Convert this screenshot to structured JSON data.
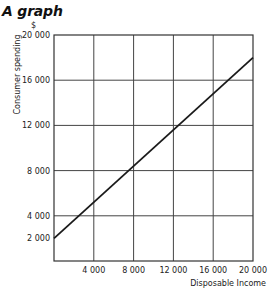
{
  "chart_data": {
    "type": "line",
    "title": "A graph",
    "xlabel": "Disposable Income",
    "ylabel": "Consumer spending",
    "y_unit": "$",
    "xlim": [
      0,
      20000
    ],
    "ylim": [
      0,
      20000
    ],
    "grid": true,
    "x_ticks": [
      4000,
      8000,
      12000,
      16000,
      20000
    ],
    "x_tick_labels": [
      "4 000",
      "8 000",
      "12 000",
      "16 000",
      "20 000"
    ],
    "y_ticks": [
      2000,
      4000,
      8000,
      12000,
      16000,
      20000
    ],
    "y_tick_labels": [
      "2 000",
      "4 000",
      "8 000",
      "12 000",
      "16 000",
      "20 000"
    ],
    "series": [
      {
        "name": "Consumer spending",
        "x": [
          0,
          20000
        ],
        "y": [
          2000,
          18000
        ],
        "color": "#1a1a1a"
      }
    ]
  },
  "labels": {
    "title": "A graph",
    "unit": "$",
    "ylabel": "Consumer spending",
    "xlabel": "Disposable Income"
  }
}
